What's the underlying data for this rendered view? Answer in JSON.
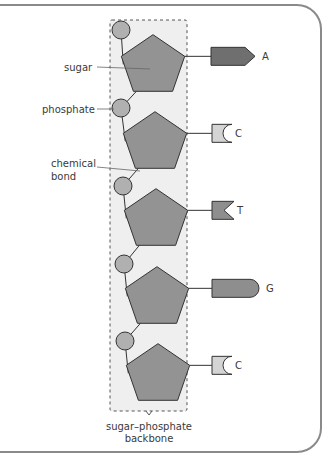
{
  "diagram": {
    "labels": {
      "sugar": "sugar",
      "phosphate": "phosphate",
      "bond_line1": "chemical",
      "bond_line2": "bond",
      "backbone_line1": "sugar–phosphate",
      "backbone_line2": "backbone"
    },
    "nucleotides": [
      {
        "base": "A",
        "shape": "arrow",
        "color": "#6f6f6f"
      },
      {
        "base": "C",
        "shape": "cup",
        "color": "#d4d4d4"
      },
      {
        "base": "T",
        "shape": "notch",
        "color": "#8e8e8e"
      },
      {
        "base": "G",
        "shape": "rounded",
        "color": "#8e8e8e"
      },
      {
        "base": "C",
        "shape": "cup",
        "color": "#d4d4d4"
      }
    ],
    "colors": {
      "sugar_fill": "#939393",
      "phosphate_fill": "#b0b0b0",
      "stroke": "#333333",
      "backbone_fill": "#efefef",
      "backbone_dash": "#555555",
      "frame": "#8a8a8a",
      "label_line": "#666666"
    }
  }
}
